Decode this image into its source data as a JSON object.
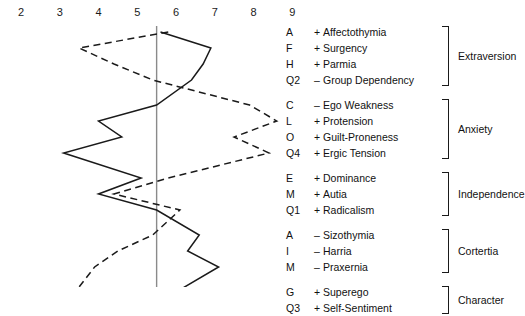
{
  "axis": {
    "ticks": [
      "2",
      "3",
      "4",
      "5",
      "6",
      "7",
      "8",
      "9"
    ],
    "min": 2,
    "max": 9
  },
  "reference_line": {
    "value": 5.5,
    "color": "#8a8a8a"
  },
  "legend": {
    "groups": [
      {
        "factor": "Extraversion",
        "rows": [
          {
            "code": "A",
            "sign": "+",
            "trait": "Affectothymia"
          },
          {
            "code": "F",
            "sign": "+",
            "trait": "Surgency"
          },
          {
            "code": "H",
            "sign": "+",
            "trait": "Parmia"
          },
          {
            "code": "Q2",
            "sign": "–",
            "trait": "Group Dependency"
          }
        ]
      },
      {
        "factor": "Anxiety",
        "rows": [
          {
            "code": "C",
            "sign": "–",
            "trait": "Ego Weakness"
          },
          {
            "code": "L",
            "sign": "+",
            "trait": "Protension"
          },
          {
            "code": "O",
            "sign": "+",
            "trait": "Guilt-Proneness"
          },
          {
            "code": "Q4",
            "sign": "+",
            "trait": "Ergic Tension"
          }
        ]
      },
      {
        "factor": "Independence",
        "rows": [
          {
            "code": "E",
            "sign": "+",
            "trait": "Dominance"
          },
          {
            "code": "M",
            "sign": "+",
            "trait": "Autia"
          },
          {
            "code": "Q1",
            "sign": "+",
            "trait": "Radicalism"
          }
        ]
      },
      {
        "factor": "Cortertia",
        "rows": [
          {
            "code": "A",
            "sign": "–",
            "trait": "Sizothymia"
          },
          {
            "code": "I",
            "sign": "–",
            "trait": "Harria"
          },
          {
            "code": "M",
            "sign": "–",
            "trait": "Praxernia"
          }
        ]
      },
      {
        "factor": "Character",
        "rows": [
          {
            "code": "G",
            "sign": "+",
            "trait": "Superego"
          },
          {
            "code": "Q3",
            "sign": "+",
            "trait": "Self-Sentiment"
          }
        ]
      }
    ]
  },
  "chart_data": {
    "type": "line",
    "title": "",
    "xlabel": "",
    "ylabel": "",
    "xlim": [
      2,
      9
    ],
    "grid": false,
    "orientation": "horizontal-profile",
    "categories": [
      "A +  Affectothymia",
      "F +  Surgency",
      "H +  Parmia",
      "Q2 –  Group Dependency",
      "C –  Ego Weakness",
      "L +  Protension",
      "O +  Guilt-Proneness",
      "Q4 +  Ergic Tension",
      "E +  Dominance",
      "M +  Autia",
      "Q1 +  Radicalism",
      "A –  Sizothymia",
      "I –  Harria",
      "M –  Praxernia",
      "G +  Superego",
      "Q3 +  Self-Sentiment"
    ],
    "series": [
      {
        "name": "Profile 1",
        "style": "solid",
        "color": "#1a1a1a",
        "values": [
          5.6,
          6.9,
          6.7,
          6.4,
          5.5,
          4.0,
          4.6,
          3.1,
          5.1,
          4.0,
          5.5,
          6.6,
          6.3,
          7.1,
          6.0,
          7.6
        ]
      },
      {
        "name": "Profile 2",
        "style": "dashed",
        "color": "#1a1a1a",
        "values": [
          5.8,
          3.5,
          4.4,
          5.4,
          7.9,
          8.6,
          7.5,
          8.4,
          5.8,
          4.4,
          6.1,
          5.4,
          4.5,
          3.9,
          3.4,
          3.0
        ]
      }
    ],
    "legend_position": "none"
  }
}
